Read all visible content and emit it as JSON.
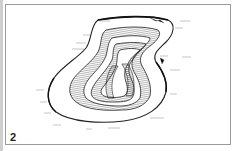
{
  "figure": {
    "panel_number": "2",
    "colors": {
      "ink": "#222222",
      "frame": "#9a9a9a",
      "background": "#ffffff"
    },
    "annotations": [
      {
        "id": "a1",
        "x": 100,
        "y": 21
      },
      {
        "id": "a2",
        "x": 180,
        "y": 21
      },
      {
        "id": "a3",
        "x": 175,
        "y": 28
      },
      {
        "id": "a4",
        "x": 83,
        "y": 35
      },
      {
        "id": "a5",
        "x": 76,
        "y": 43
      },
      {
        "id": "a6",
        "x": 72,
        "y": 49
      },
      {
        "id": "a7",
        "x": 160,
        "y": 56
      },
      {
        "id": "a8",
        "x": 182,
        "y": 57
      },
      {
        "id": "a9",
        "x": 170,
        "y": 70
      },
      {
        "id": "a10",
        "x": 170,
        "y": 94
      },
      {
        "id": "a11",
        "x": 36,
        "y": 90
      },
      {
        "id": "a12",
        "x": 40,
        "y": 102
      },
      {
        "id": "a13",
        "x": 44,
        "y": 113
      },
      {
        "id": "a14",
        "x": 53,
        "y": 125
      },
      {
        "id": "a15",
        "x": 86,
        "y": 129
      },
      {
        "id": "a16",
        "x": 108,
        "y": 128
      },
      {
        "id": "a17",
        "x": 150,
        "y": 118
      }
    ]
  }
}
